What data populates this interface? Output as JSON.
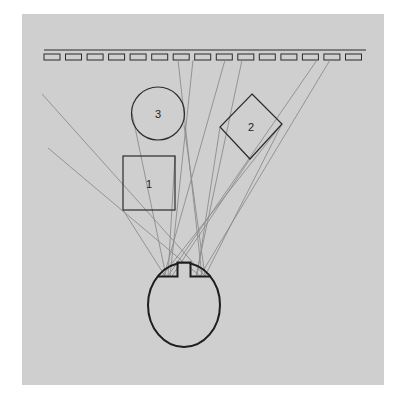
{
  "figure": {
    "objects": [
      {
        "id": "square",
        "label": "1"
      },
      {
        "id": "diamond",
        "label": "2"
      },
      {
        "id": "circle",
        "label": "3"
      }
    ],
    "detector": {
      "tile_count": 15
    },
    "colors": {
      "background": "#cfcfcf",
      "outline": "#2b2b2b",
      "ray": "#8c8c8c",
      "page": "#ffffff"
    }
  }
}
